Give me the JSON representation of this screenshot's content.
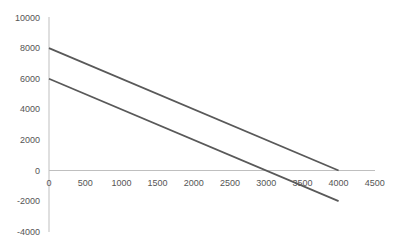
{
  "chart_data": {
    "type": "line",
    "title": "",
    "xlabel": "",
    "ylabel": "",
    "xlim": [
      0,
      4500
    ],
    "ylim": [
      -4000,
      10000
    ],
    "grid": false,
    "legend": null,
    "x_ticks": [
      "0",
      "500",
      "1000",
      "1500",
      "2000",
      "2500",
      "3000",
      "3500",
      "4000",
      "4500"
    ],
    "y_ticks": [
      "10000",
      "8000",
      "6000",
      "4000",
      "2000",
      "0",
      "-2000",
      "-4000"
    ],
    "series": [
      {
        "name": "Line 1",
        "x": [
          0,
          4000
        ],
        "y": [
          8000,
          0
        ],
        "color": "#595959"
      },
      {
        "name": "Line 2",
        "x": [
          0,
          4000
        ],
        "y": [
          6000,
          -2000
        ],
        "color": "#595959"
      }
    ]
  }
}
